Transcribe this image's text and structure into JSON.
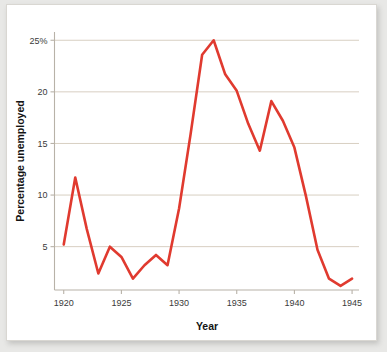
{
  "chart_data": {
    "type": "line",
    "title": "",
    "subtitle": "",
    "xlabel": "Year",
    "ylabel": "Percentage unemployed",
    "xlim": [
      1919.2,
      1945.6
    ],
    "ylim": [
      0.8,
      25.8
    ],
    "grid": true,
    "grid_axis": "y",
    "legend": false,
    "legend_position": "none",
    "line_color": "#e03a2f",
    "grid_color": "#d8cfc2",
    "axis_color": "#b8b2a8",
    "background_color": "#ffffff",
    "x_ticks": [
      1920,
      1925,
      1930,
      1935,
      1940,
      1945
    ],
    "x_tick_labels": [
      "1920",
      "1925",
      "1930",
      "1935",
      "1940",
      "1945"
    ],
    "y_ticks": [
      5,
      10,
      15,
      20,
      25
    ],
    "y_tick_labels": [
      "5",
      "10",
      "15",
      "20",
      "25%"
    ],
    "x": [
      1920,
      1921,
      1922,
      1923,
      1924,
      1925,
      1926,
      1927,
      1928,
      1929,
      1930,
      1931,
      1932,
      1933,
      1934,
      1935,
      1936,
      1937,
      1938,
      1939,
      1940,
      1941,
      1942,
      1943,
      1944,
      1945
    ],
    "categories": [
      "1920",
      "1921",
      "1922",
      "1923",
      "1924",
      "1925",
      "1926",
      "1927",
      "1928",
      "1929",
      "1930",
      "1931",
      "1932",
      "1933",
      "1934",
      "1935",
      "1936",
      "1937",
      "1938",
      "1939",
      "1940",
      "1941",
      "1942",
      "1943",
      "1944",
      "1945"
    ],
    "values": [
      5.2,
      11.7,
      6.7,
      2.4,
      5.0,
      4.0,
      1.9,
      3.2,
      4.2,
      3.2,
      8.7,
      15.9,
      23.6,
      25.0,
      21.7,
      20.1,
      16.9,
      14.3,
      19.1,
      17.2,
      14.6,
      9.9,
      4.7,
      1.9,
      1.2,
      1.9
    ],
    "series": [
      {
        "name": "Percentage unemployed",
        "color": "#e03a2f",
        "values": [
          5.2,
          11.7,
          6.7,
          2.4,
          5.0,
          4.0,
          1.9,
          3.2,
          4.2,
          3.2,
          8.7,
          15.9,
          23.6,
          25.0,
          21.7,
          20.1,
          16.9,
          14.3,
          19.1,
          17.2,
          14.6,
          9.9,
          4.7,
          1.9,
          1.2,
          1.9
        ]
      }
    ],
    "annotations": []
  }
}
